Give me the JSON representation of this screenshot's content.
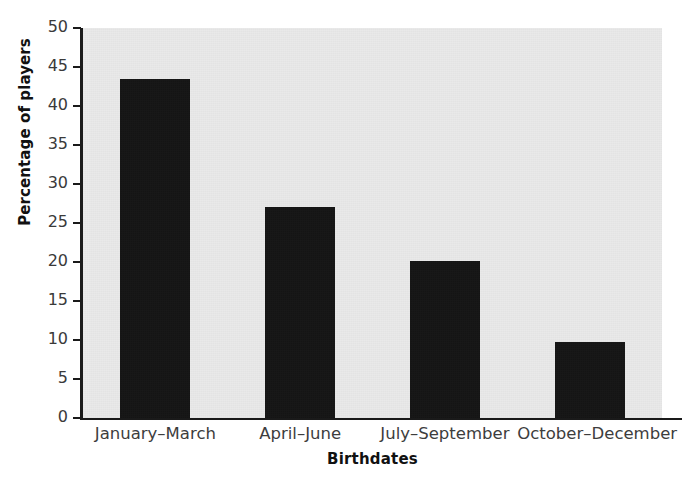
{
  "chart_data": {
    "type": "bar",
    "title": "",
    "subtitle": "",
    "categories": [
      "January–March",
      "April–June",
      "July–September",
      "October–December"
    ],
    "values": [
      43.5,
      27.1,
      20.1,
      9.7
    ],
    "xlabel": "Birthdates",
    "ylabel": "Percentage of players",
    "ylim": [
      0,
      50
    ],
    "yticks": [
      0,
      5,
      10,
      15,
      20,
      25,
      30,
      35,
      40,
      45,
      50
    ],
    "ytick_labels": [
      "0",
      "5",
      "10",
      "15",
      "20",
      "25",
      "30",
      "35",
      "40",
      "45",
      "50"
    ],
    "grid": false,
    "legend": null,
    "legend_position": "none",
    "bar_color": "#141414",
    "panel_color": "#e9e9e9",
    "axis_color": "#1a1a1a",
    "annotations": []
  }
}
